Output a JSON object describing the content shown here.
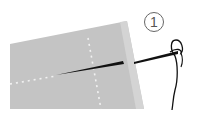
{
  "illustration": {
    "subject": "needle threaded through fabric",
    "step_number": "1",
    "colors": {
      "fabric": "#c4c4c4",
      "fabric_edge": "#d6d6d6",
      "stitch_guides": "#f2f2f2",
      "needle": "#111111",
      "thread": "#111111",
      "step_circle": "#555555"
    }
  }
}
